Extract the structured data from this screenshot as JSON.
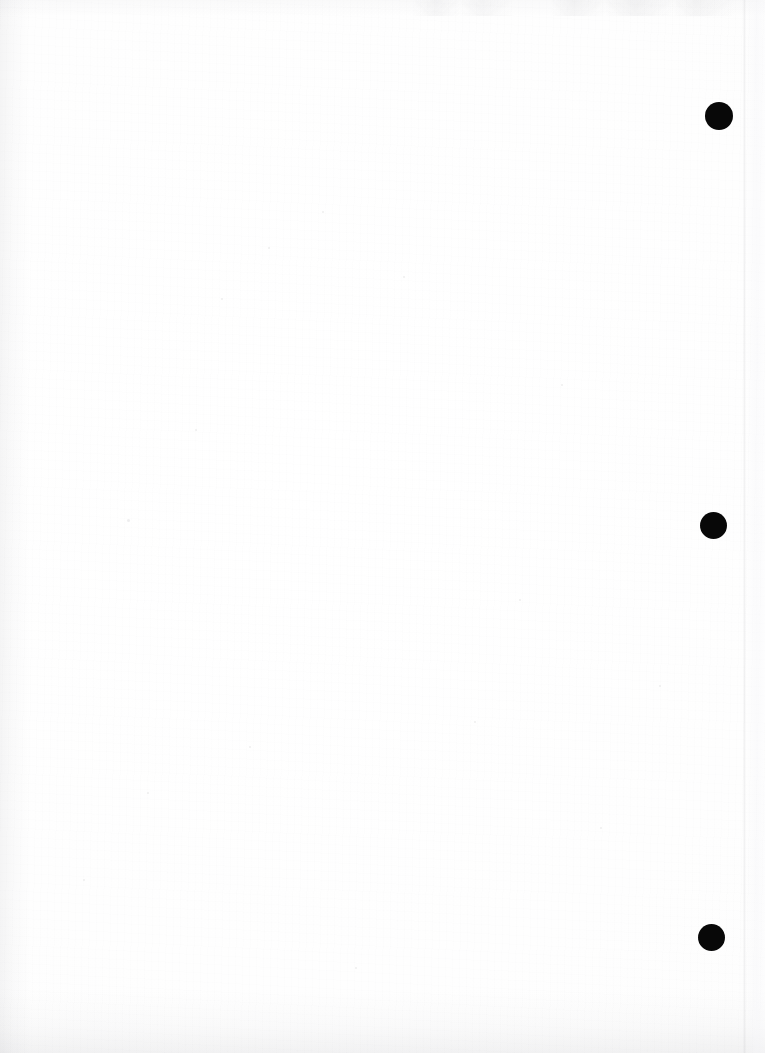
{
  "document": {
    "kind": "scanned-page",
    "page_label": "",
    "width_px": 765,
    "height_px": 1053,
    "background_color": "#fefefe",
    "body_text": "",
    "note": "blank scanned page; no printed text present"
  },
  "marks": {
    "ink_color": "#080808",
    "description": "solid black circular registration marks in the right margin",
    "count": 3,
    "items": [
      {
        "id": "mark-1",
        "shape": "circle",
        "cx": 719,
        "cy": 116,
        "diameter": 28
      },
      {
        "id": "mark-2",
        "shape": "circle",
        "cx": 713,
        "cy": 525,
        "diameter": 27
      },
      {
        "id": "mark-3",
        "shape": "circle",
        "cx": 711,
        "cy": 937,
        "diameter": 27
      }
    ]
  },
  "artifacts": {
    "page_edge_line": {
      "x": 743,
      "color": "#acacb2",
      "orientation": "vertical"
    },
    "top_bleed": {
      "present": true,
      "color": "#a8a8ae"
    },
    "bottom_shadow": {
      "present": true,
      "color": "#a0a0a6"
    },
    "left_shadow": {
      "present": true,
      "color": "#a5a5aa"
    },
    "speckles": [
      {
        "x": 128,
        "y": 520,
        "r": 1.5
      },
      {
        "x": 269,
        "y": 248,
        "r": 1.4
      },
      {
        "x": 323,
        "y": 212,
        "r": 1.2
      },
      {
        "x": 562,
        "y": 385,
        "r": 1.3
      },
      {
        "x": 222,
        "y": 299,
        "r": 1.1
      },
      {
        "x": 404,
        "y": 277,
        "r": 1.2
      },
      {
        "x": 148,
        "y": 793,
        "r": 1.3
      },
      {
        "x": 250,
        "y": 747,
        "r": 1.2
      },
      {
        "x": 475,
        "y": 722,
        "r": 1.1
      },
      {
        "x": 601,
        "y": 828,
        "r": 1.3
      },
      {
        "x": 84,
        "y": 880,
        "r": 1.2
      },
      {
        "x": 356,
        "y": 968,
        "r": 1.1
      },
      {
        "x": 660,
        "y": 686,
        "r": 1.2
      },
      {
        "x": 520,
        "y": 600,
        "r": 1.1
      },
      {
        "x": 196,
        "y": 430,
        "r": 1.2
      }
    ]
  }
}
